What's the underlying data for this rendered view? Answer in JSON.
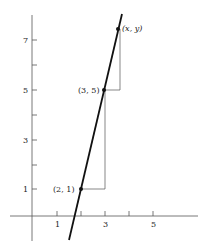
{
  "diagram": {
    "type": "coordinate-line-slope",
    "x_ticks": [
      {
        "value": 1,
        "label": "1"
      },
      {
        "value": 2,
        "label": ""
      },
      {
        "value": 3,
        "label": "3"
      },
      {
        "value": 4,
        "label": ""
      },
      {
        "value": 5,
        "label": "5"
      }
    ],
    "y_ticks": [
      {
        "value": 1,
        "label": "1"
      },
      {
        "value": 2,
        "label": ""
      },
      {
        "value": 3,
        "label": "3"
      },
      {
        "value": 4,
        "label": ""
      },
      {
        "value": 5,
        "label": "5"
      },
      {
        "value": 6,
        "label": ""
      },
      {
        "value": 7,
        "label": "7"
      }
    ],
    "points": [
      {
        "label": "(2, 1)",
        "x": 2,
        "y": 1
      },
      {
        "label": "(3, 5)",
        "x": 3,
        "y": 5
      },
      {
        "label": "(x, y)",
        "x": 3.6,
        "y": 7.4
      }
    ],
    "line": {
      "slope": 4,
      "description": "line through (2,1) and (3,5)"
    },
    "colors": {
      "line": "#111111",
      "axis": "#555555",
      "guide": "#555555"
    }
  },
  "labels": {
    "x1": "1",
    "x3": "3",
    "x5": "5",
    "y1": "1",
    "y3": "3",
    "y5": "5",
    "y7": "7",
    "p1": "(2, 1)",
    "p2": "(3, 5)",
    "p3": "(x, y)"
  }
}
